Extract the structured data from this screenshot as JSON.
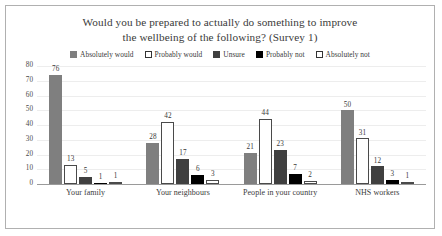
{
  "chart_data": {
    "type": "bar",
    "title": "Would you be prepared to actually do something to improve the wellbeing of the following? (Survey 1)",
    "title_lines": [
      "Would you be prepared to actually do something to improve",
      "the wellbeing of the following? (Survey 1)"
    ],
    "xlabel": "",
    "ylabel": "",
    "ylim": [
      0,
      80
    ],
    "ytick_step": 10,
    "yticks": [
      80,
      70,
      60,
      50,
      40,
      30,
      20,
      10,
      0
    ],
    "grid": true,
    "legend_position": "top",
    "categories": [
      "Your family",
      "Your neighbours",
      "People in your country",
      "NHS workers"
    ],
    "series": [
      {
        "name": "Absolutely would",
        "color": "#7f7f7f",
        "style": "bar-abs-would",
        "swatch": "swatch-abs-would",
        "values": [
          76,
          28,
          21,
          50
        ]
      },
      {
        "name": "Probably would",
        "color": "#ffffff",
        "style": "bar-prob-would",
        "swatch": "swatch-prob-would",
        "values": [
          13,
          42,
          44,
          31
        ]
      },
      {
        "name": "Unsure",
        "color": "#404040",
        "style": "bar-unsure",
        "swatch": "swatch-unsure",
        "values": [
          5,
          17,
          23,
          12
        ]
      },
      {
        "name": "Probably not",
        "color": "#000000",
        "style": "bar-prob-not",
        "swatch": "swatch-prob-not",
        "values": [
          1,
          6,
          7,
          3
        ]
      },
      {
        "name": "Absolutely not",
        "color": "#ffffff",
        "style": "bar-abs-not",
        "swatch": "swatch-abs-not",
        "values": [
          1,
          3,
          2,
          1
        ]
      }
    ]
  }
}
